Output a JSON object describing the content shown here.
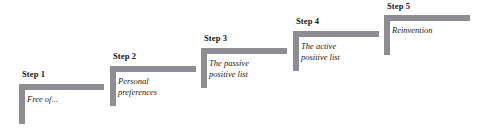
{
  "diagram": {
    "type": "staircase-steps",
    "orientation": "ascending-left-to-right",
    "bar_color": "#8d8d93",
    "label_color": "#15161a",
    "caption_color": "#1b1c20",
    "background": "#ffffff",
    "steps": [
      {
        "id": "step-1",
        "label": "Step 1",
        "caption": "Free of...",
        "x": 19,
        "y": 84,
        "width": 85,
        "height": 40,
        "label_x": 22,
        "label_y": 69,
        "caption_x": 27,
        "caption_y": 94
      },
      {
        "id": "step-2",
        "label": "Step 2",
        "caption": "Personal\npreferences",
        "x": 110,
        "y": 66,
        "width": 86,
        "height": 40,
        "label_x": 113,
        "label_y": 51,
        "caption_x": 118,
        "caption_y": 76
      },
      {
        "id": "step-3",
        "label": "Step 3",
        "caption": "The passive\npositive list",
        "x": 201,
        "y": 48,
        "width": 86,
        "height": 40,
        "label_x": 204,
        "label_y": 33,
        "caption_x": 209,
        "caption_y": 58
      },
      {
        "id": "step-4",
        "label": "Step 4",
        "caption": "The active\npositive list",
        "x": 293,
        "y": 31,
        "width": 86,
        "height": 40,
        "label_x": 296,
        "label_y": 16,
        "caption_x": 301,
        "caption_y": 41
      },
      {
        "id": "step-5",
        "label": "Step 5",
        "caption": "Reinvention",
        "x": 384,
        "y": 15,
        "width": 86,
        "height": 40,
        "label_x": 387,
        "label_y": 1,
        "caption_x": 392,
        "caption_y": 25
      }
    ]
  }
}
